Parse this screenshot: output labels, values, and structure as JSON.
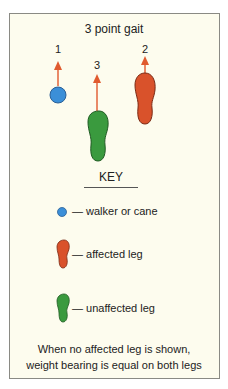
{
  "title": "3 point gait",
  "steps": [
    {
      "order": "1",
      "item": "walker or cane",
      "color": "#3b8fd8"
    },
    {
      "order": "2",
      "item": "affected leg",
      "color": "#d9522b"
    },
    {
      "order": "3",
      "item": "unaffected leg",
      "color": "#3a9a3e"
    }
  ],
  "arrow_color": "#e05a2e",
  "key": {
    "title": "KEY",
    "items": [
      {
        "label": "— walker or cane"
      },
      {
        "label": "— affected leg"
      },
      {
        "label": "— unaffected leg"
      }
    ]
  },
  "note": {
    "line1": "When no affected leg is shown,",
    "line2": "weight bearing is equal on both legs"
  }
}
